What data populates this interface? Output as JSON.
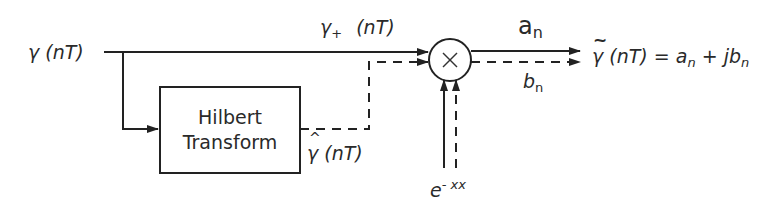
{
  "diagram": {
    "input": {
      "symbol": "γ",
      "arg": "(nT)"
    },
    "upper_path": {
      "symbol": "γ",
      "subscript": "+",
      "arg": "(nT)"
    },
    "hilbert_block": {
      "line1": "Hilbert",
      "line2": "Transform"
    },
    "hilbert_output": {
      "symbol": "γ",
      "arg": "(nT)"
    },
    "multiplier": {
      "symbol": "×"
    },
    "exponential": {
      "base": "e",
      "exponent": "- xx"
    },
    "output_real": {
      "symbol": "a",
      "subscript": "n"
    },
    "output_imag": {
      "symbol": "b",
      "subscript": "n"
    },
    "output_eq": {
      "symbol": "γ",
      "arg": "(nT) =",
      "a": "a",
      "a_sub": "n",
      "plus": "+",
      "jb": "jb",
      "b_sub": "n"
    },
    "colors": {
      "line": "#222222",
      "background": "#ffffff"
    }
  }
}
